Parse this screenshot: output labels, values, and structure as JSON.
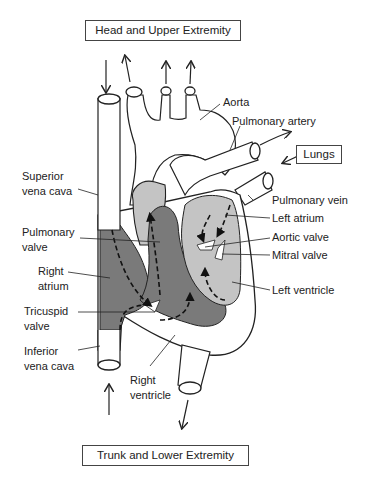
{
  "diagram": {
    "destinations": {
      "top": "Head and Upper Extremity",
      "bottom": "Trunk and Lower Extremity",
      "right": "Lungs"
    },
    "labels": {
      "aorta": "Aorta",
      "pulmonary_artery": "Pulmonary artery",
      "superior_vena_cava": [
        "Superior",
        "vena cava"
      ],
      "pulmonary_vein": "Pulmonary vein",
      "left_atrium": "Left atrium",
      "pulmonary_valve": [
        "Pulmonary",
        "valve"
      ],
      "aortic_valve": "Aortic valve",
      "mitral_valve": "Mitral valve",
      "right_atrium": [
        "Right",
        "atrium"
      ],
      "left_ventricle": "Left ventricle",
      "tricuspid_valve": [
        "Tricuspid",
        "valve"
      ],
      "inferior_vena_cava": [
        "Inferior",
        "vena cava"
      ],
      "right_ventricle": [
        "Right",
        "ventricle"
      ]
    },
    "colors": {
      "deoxygenated": "#7a7a7a",
      "oxygenated": "#c4c4c4",
      "vessel": "#ffffff",
      "outline": "#222222"
    }
  }
}
